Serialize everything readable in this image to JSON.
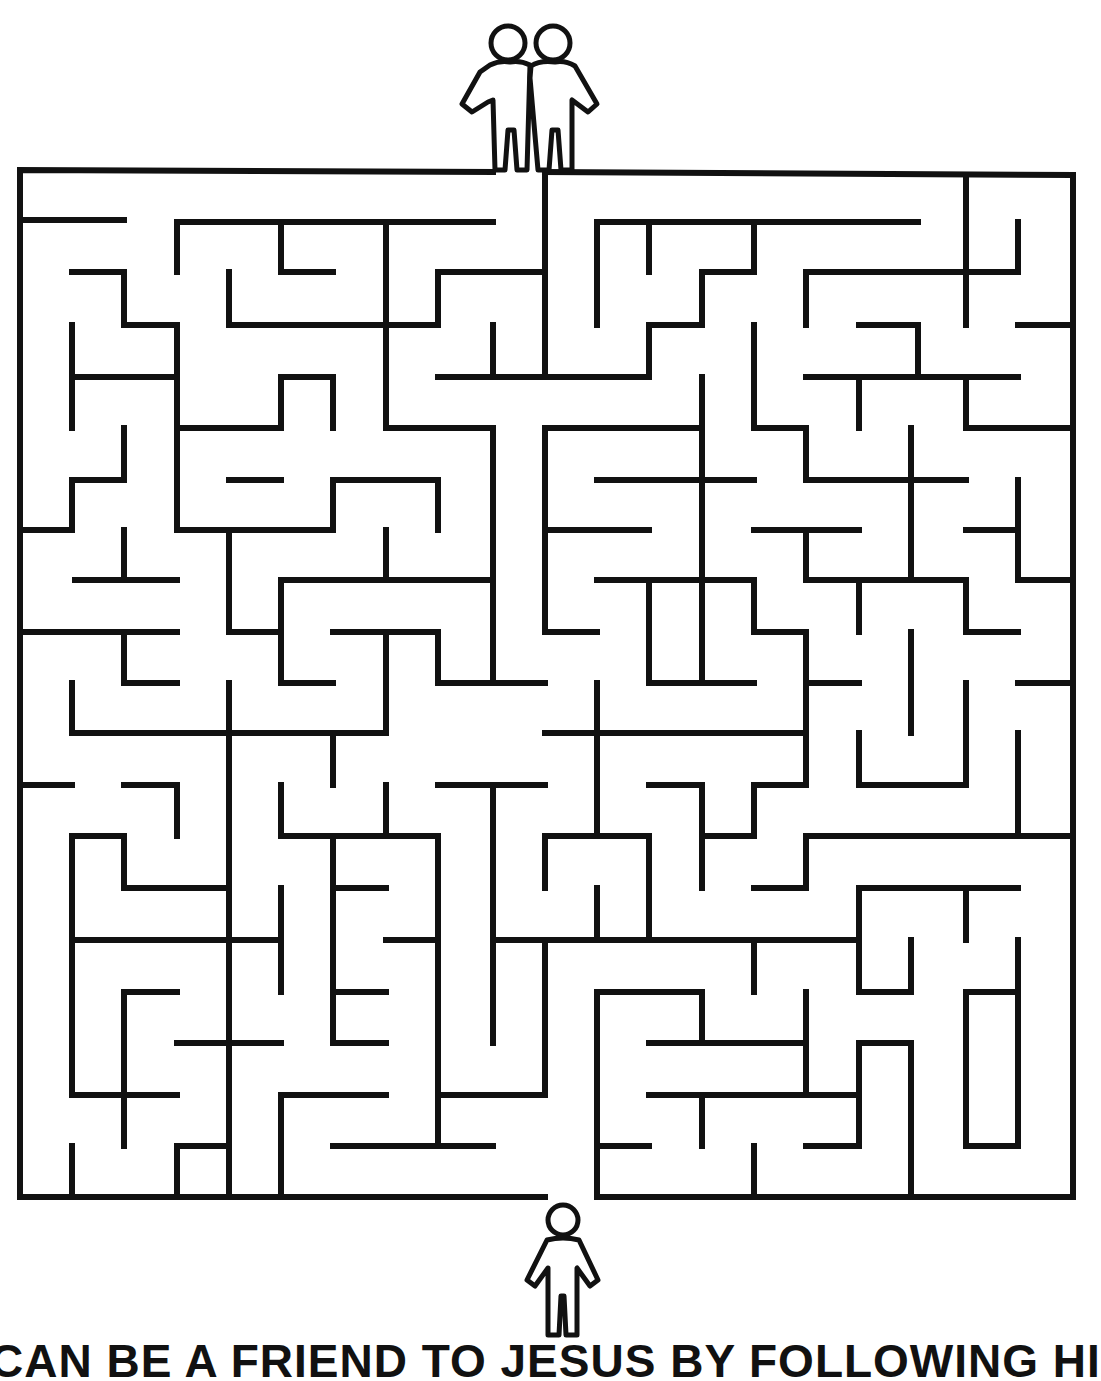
{
  "puzzle": {
    "type": "maze",
    "start_label": "single person figure (bottom entrance)",
    "finish_label": "two friends figure (top entrance)",
    "ink_color": "#111111",
    "background_color": "#ffffff"
  },
  "caption": {
    "text": "CAN BE A FRIEND TO JESUS BY FOLLOWING HI"
  },
  "icons": {
    "top": "two-friends-icon",
    "bottom": "person-icon"
  }
}
